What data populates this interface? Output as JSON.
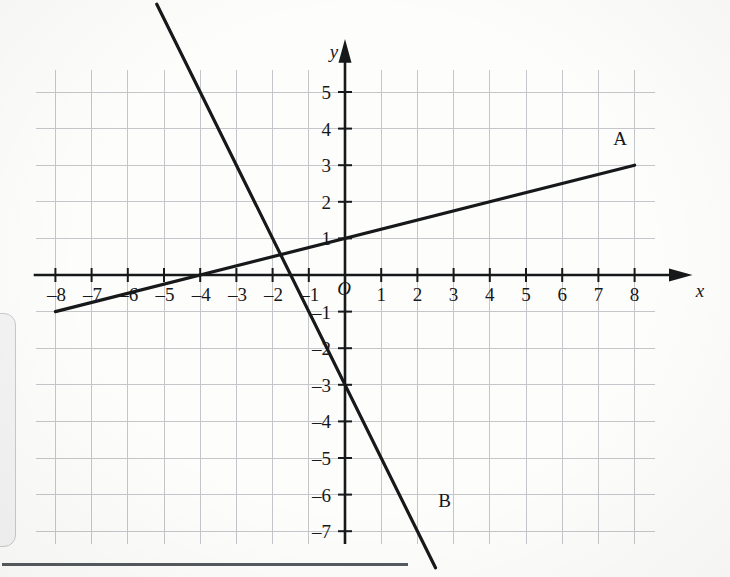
{
  "chart_data": {
    "type": "line",
    "title": "",
    "xlabel": "x",
    "ylabel": "y",
    "origin_label": "O",
    "grid": true,
    "xlim": [
      -8.9,
      8.9
    ],
    "ylim": [
      -7.4,
      5.7
    ],
    "xticks": [
      -8,
      -7,
      -6,
      -5,
      -4,
      -3,
      -2,
      -1,
      1,
      2,
      3,
      4,
      5,
      6,
      7,
      8
    ],
    "yticks": [
      5,
      4,
      3,
      2,
      1,
      -1,
      -2,
      -3,
      -4,
      -5,
      -6,
      -7
    ],
    "xtick_labels": [
      "–8",
      "–7",
      "–6",
      "–5",
      "–4",
      "–3",
      "–2",
      "–1",
      "1",
      "2",
      "3",
      "4",
      "5",
      "6",
      "7",
      "8"
    ],
    "ytick_labels": [
      "5",
      "4",
      "3",
      "2",
      "1",
      "–1",
      "–2",
      "–3",
      "–4",
      "–5",
      "–6",
      "–7"
    ],
    "legend_position": "inline-endpoint",
    "series": [
      {
        "name": "A",
        "label": "A",
        "equation": "y = 0.25x + 1",
        "slope": 0.25,
        "intercept": 1,
        "x": [
          -8,
          8
        ],
        "values": [
          -1,
          3
        ],
        "color": "#16181a"
      },
      {
        "name": "B",
        "label": "B",
        "equation": "y = –2x – 3",
        "slope": -2,
        "intercept": -3,
        "x": [
          -5.2,
          2.5
        ],
        "values": [
          7.4,
          -8
        ],
        "color": "#16181a"
      }
    ],
    "annotations": [
      {
        "text": "A",
        "x": 7.6,
        "y": 3.55
      },
      {
        "text": "B",
        "x": 2.75,
        "y": -6.35
      }
    ],
    "colors": {
      "grid": "#c4c6c9",
      "axis": "#16181a",
      "line": "#16181a",
      "background": "#fdfdfc"
    }
  },
  "panel": {
    "side_panel_name": "cropped-ui-panel",
    "bottom_rule_name": "bottom-divider"
  }
}
